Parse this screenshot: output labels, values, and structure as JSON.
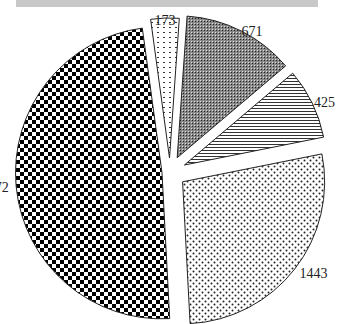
{
  "header": {
    "bar_color": "#c8c8c8"
  },
  "chart_data": {
    "type": "pie",
    "title": "",
    "exploded": true,
    "categories": [
      "173",
      "671",
      "425",
      "1443",
      "2572"
    ],
    "values": [
      173,
      671,
      425,
      1443,
      2572
    ],
    "labels": [
      "173",
      "671",
      "425",
      "1443",
      "2572"
    ],
    "patterns": [
      "dashed-dots",
      "fine-dark-grid",
      "horizontal-lines",
      "dots",
      "checkerboard"
    ],
    "legend": null
  }
}
